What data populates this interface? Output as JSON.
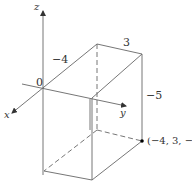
{
  "figure": {
    "type": "3d-coordinate-box",
    "axes": {
      "x_label": "x",
      "y_label": "y",
      "z_label": "z",
      "origin_label": "0"
    },
    "dimension_labels": {
      "x_edge": "−4",
      "y_edge": "3",
      "z_edge": "−5"
    },
    "point": {
      "label": "(−4, 3, −5)",
      "coords": [
        -4,
        3,
        -5
      ]
    },
    "colors": {
      "line": "#555555",
      "text": "#333333",
      "point": "#000000"
    }
  }
}
